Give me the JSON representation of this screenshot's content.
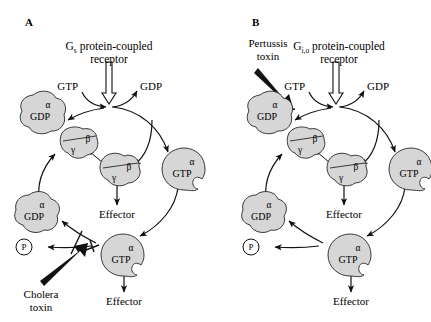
{
  "figure": {
    "background": "#ffffff",
    "blob_fill": "#d6d6d6",
    "stroke": "#3a3a3a",
    "line_color": "#111111"
  },
  "panels": [
    {
      "letter": "A",
      "receptor": {
        "name_main": "G",
        "name_sub": "s",
        "name_rest": " protein-coupled",
        "line2": "receptor"
      },
      "nucleotide_in": "GTP",
      "nucleotide_out": "GDP",
      "alpha_gdp_top": {
        "greek": "α",
        "nucleotide": "GDP"
      },
      "betagamma_top": {
        "beta": "β",
        "gamma": "γ"
      },
      "betagamma_free": {
        "beta": "β",
        "gamma": "γ"
      },
      "alpha_gtp_right": {
        "greek": "α",
        "nucleotide": "GTP"
      },
      "alpha_gtp_bottom": {
        "greek": "α",
        "nucleotide": "GTP"
      },
      "alpha_gdp_bottom": {
        "greek": "α",
        "nucleotide": "GDP"
      },
      "phosphate": "P",
      "effector_betagamma": "Effector",
      "effector_alpha": "Effector",
      "toxin": {
        "line1": "Cholera",
        "line2": "toxin",
        "target": "gtp-hydrolysis-step",
        "symbol": "inhibition-tbar"
      }
    },
    {
      "letter": "B",
      "receptor": {
        "name_main": "G",
        "name_sub": "i,o",
        "name_rest": " protein-coupled",
        "line2": "receptor"
      },
      "nucleotide_in": "GTP",
      "nucleotide_out": "GDP",
      "alpha_gdp_top": {
        "greek": "α",
        "nucleotide": "GDP"
      },
      "betagamma_top": {
        "beta": "β",
        "gamma": "γ"
      },
      "betagamma_free": {
        "beta": "β",
        "gamma": "γ"
      },
      "alpha_gtp_right": {
        "greek": "α",
        "nucleotide": "GTP"
      },
      "alpha_gtp_bottom": {
        "greek": "α",
        "nucleotide": "GTP"
      },
      "alpha_gdp_bottom": {
        "greek": "α",
        "nucleotide": "GDP"
      },
      "phosphate": "P",
      "effector_betagamma": "Effector",
      "effector_alpha": "Effector",
      "toxin": {
        "line1": "Pertussis",
        "line2": "toxin",
        "target": "receptor-activation-step",
        "symbol": "inhibition-tbar"
      }
    }
  ]
}
